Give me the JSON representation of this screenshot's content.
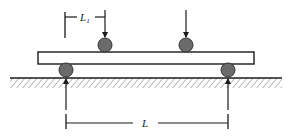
{
  "diagram": {
    "labels": {
      "load_span": "L",
      "load_span_sub": "1",
      "support_span": "L"
    },
    "colors": {
      "line": "#1a1a1a",
      "roller_fill": "#6b6b6b",
      "beam_fill": "#ffffff",
      "hatch": "#555555"
    },
    "components": {
      "beam": {
        "x": 38,
        "y": 52,
        "width": 216,
        "height": 12
      },
      "loading_rollers": [
        {
          "cx": 105,
          "cy": 45,
          "r": 7
        },
        {
          "cx": 186,
          "cy": 45,
          "r": 7
        }
      ],
      "support_rollers": [
        {
          "cx": 66,
          "cy": 70,
          "r": 7
        },
        {
          "cx": 228,
          "cy": 70,
          "r": 7
        }
      ],
      "ground": {
        "y": 78,
        "x1": 10,
        "x2": 282
      }
    }
  }
}
